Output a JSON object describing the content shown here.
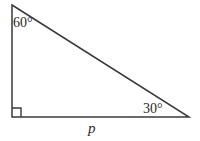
{
  "figure": {
    "background_color": "#ffffff",
    "stroke_color": "#3a3a3a",
    "text_color": "#2b2b2b",
    "stroke_width": 1.5,
    "width": 200,
    "height": 141
  },
  "shape": {
    "type": "right triangle",
    "vertices": {
      "apex": {
        "x": 12,
        "y": 5
      },
      "right_angle": {
        "x": 12,
        "y": 117
      },
      "base_right": {
        "x": 189,
        "y": 117
      }
    },
    "path": "M 12 5 L 189 117 L 12 117 Z",
    "right_angle_marker": {
      "path": "M 12 108 L 21 108 L 21 117",
      "size": 9
    }
  },
  "labels": {
    "angle_apex": "60°",
    "angle_base_right": "30°",
    "side_base": "p"
  },
  "measurements": {
    "angle_apex_degrees": 60,
    "angle_base_right_degrees": 30,
    "angle_bottom_left_degrees": 90,
    "base_side_name": "p"
  }
}
